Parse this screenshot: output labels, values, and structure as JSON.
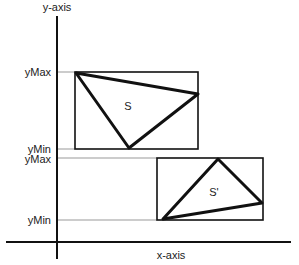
{
  "diagram": {
    "y_axis_label": "y-axis",
    "x_axis_label": "x-axis",
    "shape_s": {
      "label": "S",
      "ymax_label": "yMax",
      "ymin_label": "yMin"
    },
    "shape_s_prime": {
      "label": "S'",
      "ymax_label": "yMax",
      "ymin_label": "yMin"
    },
    "colors": {
      "stroke": "#111111",
      "guide": "#bbbbbb",
      "background": "#ffffff"
    }
  }
}
